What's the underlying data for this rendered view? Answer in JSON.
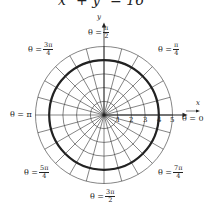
{
  "equation": "x² + y² = 16",
  "chart_data": {
    "type": "polar",
    "title": "x² + y² = 16",
    "curve": {
      "kind": "circle",
      "r": 4,
      "center": [
        0,
        0
      ],
      "stroke": "#222222"
    },
    "grid": {
      "radii": [
        1,
        2,
        3,
        4,
        5
      ],
      "spokes_deg_step": 15
    },
    "radial_tick_labels": [
      "1",
      "2",
      "3",
      "4",
      "5"
    ],
    "axis_labels": {
      "x": "x",
      "y": "y"
    },
    "angle_labels": [
      {
        "id": "0",
        "text": "θ = 0",
        "num": "",
        "den": ""
      },
      {
        "id": "pi_4",
        "text": "θ =",
        "num": "π",
        "den": "4"
      },
      {
        "id": "pi_2",
        "text": "θ =",
        "num": "π",
        "den": "2"
      },
      {
        "id": "3pi_4",
        "text": "θ =",
        "num": "3π",
        "den": "4"
      },
      {
        "id": "pi",
        "text": "θ = π",
        "num": "",
        "den": ""
      },
      {
        "id": "5pi_4",
        "text": "θ =",
        "num": "5π",
        "den": "4"
      },
      {
        "id": "3pi_2",
        "text": "θ =",
        "num": "3π",
        "den": "2"
      },
      {
        "id": "7pi_4",
        "text": "θ =",
        "num": "7π",
        "den": "4"
      }
    ]
  },
  "colors": {
    "grid": "#333333",
    "curve": "#222222",
    "background": "#ffffff"
  }
}
